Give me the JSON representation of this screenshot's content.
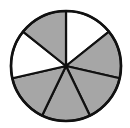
{
  "diagram": {
    "type": "fraction-circle",
    "total_sectors": 7,
    "shaded_sectors": 5,
    "fraction_shaded": "5/7",
    "start_angle_deg": 0,
    "direction": "clockwise-from-top",
    "sectors": [
      {
        "index": 0,
        "shaded": false
      },
      {
        "index": 1,
        "shaded": true
      },
      {
        "index": 2,
        "shaded": true
      },
      {
        "index": 3,
        "shaded": true
      },
      {
        "index": 4,
        "shaded": true
      },
      {
        "index": 5,
        "shaded": false
      },
      {
        "index": 6,
        "shaded": true
      }
    ],
    "colors": {
      "shaded": "#a6a6a6",
      "unshaded": "#ffffff",
      "stroke": "#111111"
    },
    "geometry": {
      "cx": 66,
      "cy": 66,
      "r": 55,
      "stroke_width": 2.2
    }
  }
}
